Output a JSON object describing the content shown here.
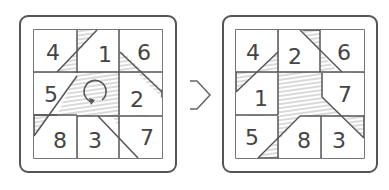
{
  "diagram": {
    "type": "puzzle-rotation",
    "before": {
      "grid": [
        [
          "4",
          "1",
          "6"
        ],
        [
          "5",
          "",
          "2"
        ],
        [
          "8",
          "3",
          "7"
        ]
      ],
      "center_symbol": "rotate-clockwise-icon"
    },
    "after": {
      "grid": [
        [
          "4",
          "2",
          "6"
        ],
        [
          "1",
          "",
          "7"
        ],
        [
          "5",
          "8",
          "3"
        ]
      ]
    },
    "arrow": "right-open-arrow"
  },
  "before": {
    "cells": {
      "c00": "4",
      "c01": "1",
      "c02": "6",
      "c10": "5",
      "c12": "2",
      "c20": "8",
      "c21": "3",
      "c22": "7"
    }
  },
  "after": {
    "cells": {
      "c00": "4",
      "c01": "2",
      "c02": "6",
      "c10": "1",
      "c12": "7",
      "c20": "5",
      "c21": "8",
      "c22": "3"
    }
  },
  "colors": {
    "stroke": "#555555",
    "hatch": "#bdbdbd",
    "background": "#ffffff"
  }
}
